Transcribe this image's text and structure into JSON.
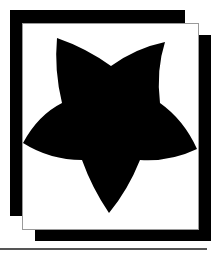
{
  "artwork": {
    "subject": "star-icon",
    "colors": {
      "fill": "#000000",
      "background": "#ffffff",
      "card_border": "#9a9a9a",
      "rule": "#555555"
    }
  }
}
